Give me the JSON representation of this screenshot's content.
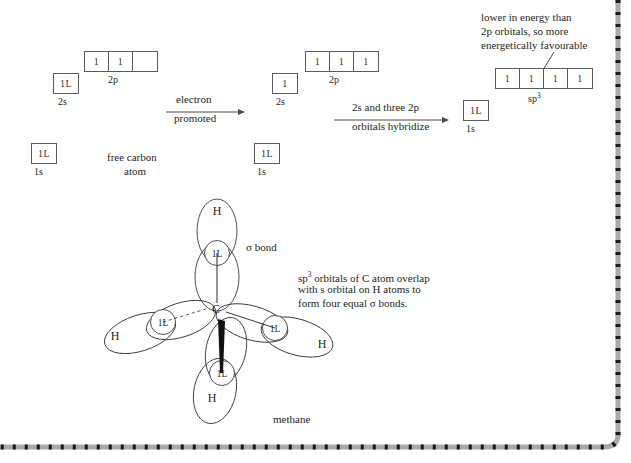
{
  "diagram": {
    "ink_color": "#231f20",
    "line_color": "#5b5b5b",
    "border_color": "#3a3a3a"
  },
  "stage1": {
    "name": "free carbon atom",
    "caption_line1": "free carbon",
    "caption_line2": "atom",
    "orbitals": [
      {
        "label": "2p",
        "cells": [
          "1",
          "1",
          ""
        ]
      },
      {
        "label": "2s",
        "cells": [
          "1L"
        ]
      },
      {
        "label": "1s",
        "cells": [
          "1L"
        ]
      }
    ]
  },
  "arrow1": {
    "label_line1": "electron",
    "label_line2": "promoted"
  },
  "stage2": {
    "name": "promoted carbon atom",
    "orbitals": [
      {
        "label": "2p",
        "cells": [
          "1",
          "1",
          "1"
        ]
      },
      {
        "label": "2s",
        "cells": [
          "1"
        ]
      },
      {
        "label": "1s",
        "cells": [
          "1L"
        ]
      }
    ]
  },
  "arrow2": {
    "label_line1": "2s and three 2p",
    "label_line2": "orbitals hybridize"
  },
  "stage3": {
    "name": "sp3 hybridized carbon atom",
    "annotation": {
      "line1": "lower in energy than",
      "line2": "2p orbitals, so more",
      "line3": "energetically favourable"
    },
    "orbitals": [
      {
        "label": "sp",
        "label_sup": "3",
        "cells": [
          "1",
          "1",
          "1",
          "1"
        ]
      },
      {
        "label": "1s",
        "cells": [
          "1L"
        ]
      }
    ]
  },
  "methane": {
    "caption": "methane",
    "central_atom": "C",
    "sigma_bond_label": "σ bond",
    "note": {
      "line1": "sp3 orbitals of C atom overlap",
      "line1_pre": "sp",
      "line1_sup": "3",
      "line1_post": " orbitals of C atom overlap",
      "line2": "with s orbital on H atoms to",
      "line3": "form four equal σ bonds."
    },
    "bonds": [
      {
        "id": "top",
        "hydrogen": "H",
        "electron_pair": "1L",
        "bond_style": "plain"
      },
      {
        "id": "left",
        "hydrogen": "H",
        "electron_pair": "1L",
        "bond_style": "dashed"
      },
      {
        "id": "right",
        "hydrogen": "H",
        "electron_pair": "1L",
        "bond_style": "plain"
      },
      {
        "id": "bottom",
        "hydrogen": "H",
        "electron_pair": "1L",
        "bond_style": "wedge"
      }
    ]
  }
}
